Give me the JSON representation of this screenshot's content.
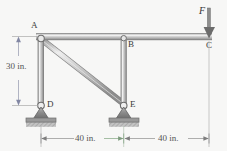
{
  "figure": {
    "type": "statics-frame-diagram",
    "background_color": "#f7f7f6",
    "member_color": "#a8a8a8",
    "member_highlight": "#e8e8e8",
    "outline_color": "#7d7d7d",
    "dimension_color": "#8f8f8f",
    "arrow_color": "#8a8ea8",
    "force_color": "#555555"
  },
  "joints": [
    {
      "id": "A",
      "label": "A",
      "x": 41,
      "y": 37,
      "type": "pin-joint"
    },
    {
      "id": "B",
      "label": "B",
      "x": 124,
      "y": 37,
      "type": "pin-joint"
    },
    {
      "id": "C",
      "label": "C",
      "x": 209,
      "y": 37,
      "type": "beam-end"
    },
    {
      "id": "D",
      "label": "D",
      "x": 41,
      "y": 105,
      "type": "pin-support"
    },
    {
      "id": "E",
      "label": "E",
      "x": 124,
      "y": 105,
      "type": "pin-support"
    }
  ],
  "members": [
    {
      "from": "A",
      "to": "C",
      "name": "beam-AC"
    },
    {
      "from": "A",
      "to": "D",
      "name": "column-AD"
    },
    {
      "from": "B",
      "to": "E",
      "name": "column-BE"
    },
    {
      "from": "A",
      "to": "E",
      "name": "diagonal-AE"
    }
  ],
  "load": {
    "label": "F",
    "at": "C",
    "direction": "down",
    "name": "applied-force-F"
  },
  "supports": [
    {
      "at": "D",
      "kind": "pin",
      "ground": "hatched"
    },
    {
      "at": "E",
      "kind": "pin",
      "ground": "hatched"
    }
  ],
  "dimensions": [
    {
      "name": "height-AD",
      "text": "30 in.",
      "orientation": "vertical",
      "from": "A",
      "to": "D",
      "value": 30,
      "unit": "in."
    },
    {
      "name": "span-DE",
      "text": "40 in.",
      "orientation": "horizontal",
      "from": "D",
      "to": "E",
      "value": 40,
      "unit": "in."
    },
    {
      "name": "span-EC",
      "text": "40 in.",
      "orientation": "horizontal",
      "from": "E",
      "to": "C",
      "value": 40,
      "unit": "in."
    }
  ],
  "labels": {
    "A": "A",
    "B": "B",
    "C": "C",
    "D": "D",
    "E": "E",
    "F": "F",
    "dim_vertical": "30 in.",
    "dim_left": "40 in.",
    "dim_right": "40 in."
  }
}
